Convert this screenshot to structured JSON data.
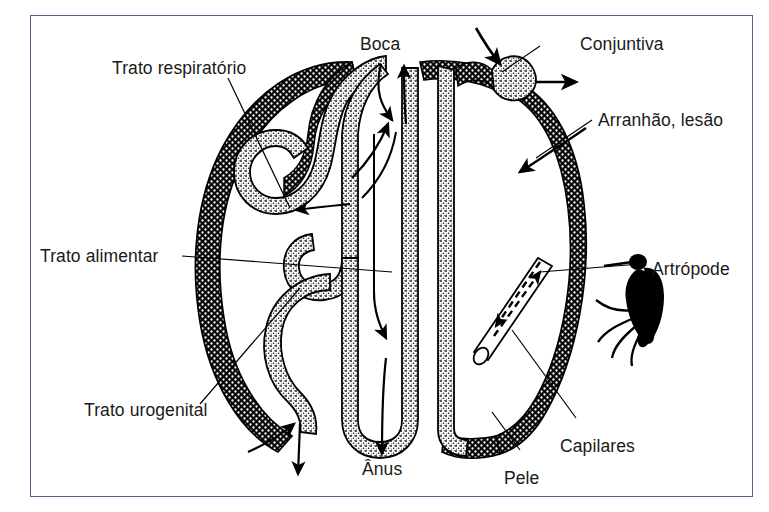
{
  "figure": {
    "title_visible": false,
    "language": "pt-BR",
    "frame_color": "#5a6387",
    "background_color": "#ffffff",
    "ink_color": "#000000"
  },
  "labels": {
    "trato_respiratorio": "Trato respiratório",
    "trato_alimentar": "Trato alimentar",
    "trato_urogenital": "Trato urogenital",
    "boca": "Boca",
    "anus": "Ânus",
    "conjuntiva": "Conjuntiva",
    "arranhao_lesao": "Arranhão, lesão",
    "artropode": "Artrópode",
    "capilares": "Capilares",
    "pele": "Pele"
  },
  "structures": {
    "skin_layer": "dark-stippled-outer-body-wall",
    "mucosa_layer": "light-stippled-inner-lining",
    "arthropod": "mosquito-silhouette",
    "capillary": "open-ended-cylindrical-tube"
  },
  "flow_arrows": {
    "mouth_in": "seta-entrada-boca",
    "mouth_out": "seta-saida-boca",
    "respiratory_in": "seta-trato-respiratorio",
    "anus_out": "seta-saida-anus",
    "urogenital_out": "seta-saida-urogenital",
    "urogenital_in": "seta-entrada-urogenital",
    "conjunctiva_in": "seta-entrada-conjuntiva",
    "conjunctiva_out": "seta-saida-conjuntiva",
    "scratch_in": "seta-entrada-arranhao",
    "capillary_bidirectional": "setas-tracejadas-capilares"
  }
}
